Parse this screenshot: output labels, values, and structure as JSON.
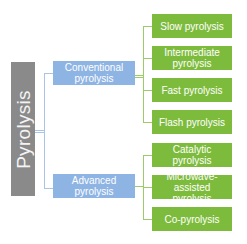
{
  "diagram": {
    "root": {
      "label": "Pyrolysis",
      "color": "#8a8a8a"
    },
    "categories": [
      {
        "label": "Conventional pyrolysis",
        "color": "#8eb4e3",
        "children": [
          {
            "label": "Slow pyrolysis"
          },
          {
            "label": "Intermediate pyrolysis"
          },
          {
            "label": "Fast pyrolysis"
          },
          {
            "label": "Flash pyrolysis"
          }
        ]
      },
      {
        "label": "Advanced pyrolysis",
        "color": "#8eb4e3",
        "children": [
          {
            "label": "Catalytic pyrolysis"
          },
          {
            "label": "Microwave-assisted pyrolysis"
          },
          {
            "label": "Co-pyrolysis"
          }
        ]
      }
    ],
    "leaf_color": "#7dbb3c"
  }
}
